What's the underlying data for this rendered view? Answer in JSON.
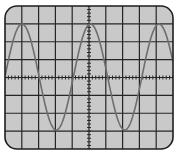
{
  "colors": {
    "background": "#ffffff",
    "screen": "#c9c9c9",
    "grid": "#262626",
    "border": "#1e1e1e",
    "wave": "#6e6e6e"
  },
  "screen": {
    "x": 5,
    "y": 6,
    "width": 168,
    "height": 143,
    "corner_radius": 12
  },
  "grid": {
    "columns": 10,
    "rows": 8,
    "center_ticks_per_division": 5
  },
  "wave": {
    "type": "sine",
    "center_y": 77,
    "amplitude_px": 53,
    "period_px": 68.5,
    "first_peak_x": 22,
    "x_start": 5,
    "x_end": 173
  }
}
